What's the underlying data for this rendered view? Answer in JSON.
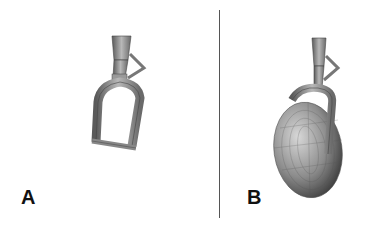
{
  "figure": {
    "panels": [
      {
        "label": "A",
        "description": "Landing gear fork and strut without wheel"
      },
      {
        "label": "B",
        "description": "Landing gear fork and strut with wheel and tire"
      }
    ],
    "colors": {
      "metal": "#8a8a8a",
      "metal_dark": "#4a4a4a",
      "metal_light": "#c8c8c8",
      "divider": "#555555",
      "label": "#111111"
    }
  }
}
